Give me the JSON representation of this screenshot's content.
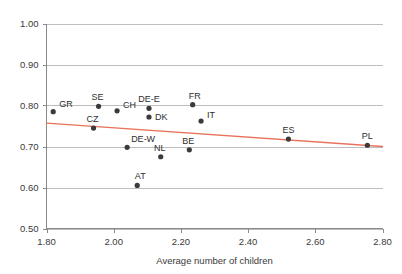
{
  "chart_data": {
    "type": "scatter",
    "title": "",
    "xlabel": "Average number of children",
    "ylabel": "",
    "xlim": [
      1.8,
      2.8
    ],
    "ylim": [
      0.5,
      1.0
    ],
    "grid": true,
    "legend": "none",
    "xticks": [
      "1.80",
      "2.00",
      "2.20",
      "2.40",
      "2.60",
      "2.80"
    ],
    "xtick_values": [
      1.8,
      2.0,
      2.2,
      2.4,
      2.6,
      2.8
    ],
    "yticks": [
      "0.50",
      "0.60",
      "0.70",
      "0.80",
      "0.90",
      "1.00"
    ],
    "ytick_values": [
      0.5,
      0.6,
      0.7,
      0.8,
      0.9,
      1.0
    ],
    "point_color": "#3b3b3b",
    "trend_color": "#e8735a",
    "grid_color": "#bdbdbd",
    "axis_color": "#8a8a8a",
    "points": [
      {
        "label": "GR",
        "x": 1.82,
        "y": 0.785,
        "label_dx": 6,
        "label_dy": -5
      },
      {
        "label": "CZ",
        "x": 1.94,
        "y": 0.745,
        "label_dx": -1,
        "label_dy": -6
      },
      {
        "label": "SE",
        "x": 1.955,
        "y": 0.798,
        "label_dx": -1,
        "label_dy": -6
      },
      {
        "label": "CH",
        "x": 2.01,
        "y": 0.787,
        "label_dx": 6,
        "label_dy": -3
      },
      {
        "label": "DE-W",
        "x": 2.04,
        "y": 0.698,
        "label_dx": 4,
        "label_dy": -5
      },
      {
        "label": "AT",
        "x": 2.07,
        "y": 0.605,
        "label_dx": 3,
        "label_dy": -6
      },
      {
        "label": "DE-E",
        "x": 2.105,
        "y": 0.793,
        "label_dx": 0,
        "label_dy": -6
      },
      {
        "label": "DK",
        "x": 2.105,
        "y": 0.772,
        "label_dx": 6,
        "label_dy": 3
      },
      {
        "label": "NL",
        "x": 2.14,
        "y": 0.675,
        "label_dx": -1,
        "label_dy": -6
      },
      {
        "label": "BE",
        "x": 2.225,
        "y": 0.692,
        "label_dx": -1,
        "label_dy": -6
      },
      {
        "label": "FR",
        "x": 2.235,
        "y": 0.802,
        "label_dx": 2,
        "label_dy": -6
      },
      {
        "label": "IT",
        "x": 2.26,
        "y": 0.762,
        "label_dx": 6,
        "label_dy": -3
      },
      {
        "label": "ES",
        "x": 2.52,
        "y": 0.718,
        "label_dx": 0,
        "label_dy": -6
      },
      {
        "label": "PL",
        "x": 2.755,
        "y": 0.703,
        "label_dx": 0,
        "label_dy": -6
      }
    ],
    "trend": {
      "x0": 1.8,
      "y0": 0.757,
      "x1": 2.8,
      "y1": 0.7
    }
  }
}
